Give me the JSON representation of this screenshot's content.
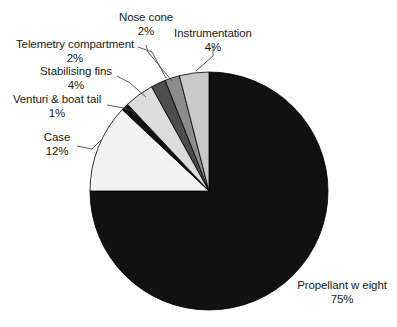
{
  "chart_data": {
    "type": "pie",
    "title": "",
    "subtitle": "",
    "xlabel": "",
    "ylabel": "",
    "grid": false,
    "legend_position": "none",
    "label_format": "name + percent",
    "start_angle_deg": 0,
    "direction": "clockwise",
    "categories": [
      "Propellant w eight",
      "Case",
      "Venturi & boat tail",
      "Stabilising fins",
      "Telemetry compartment",
      "Nose cone",
      "Instrumentation"
    ],
    "values": [
      75,
      12,
      1,
      4,
      2,
      2,
      4
    ],
    "unit": "%",
    "slices": [
      {
        "name": "Propellant w eight",
        "value": 75,
        "percent_label": "75%",
        "color": "#111111"
      },
      {
        "name": "Case",
        "value": 12,
        "percent_label": "12%",
        "color": "#f2f2f2"
      },
      {
        "name": "Venturi & boat tail",
        "value": 1,
        "percent_label": "1%",
        "color": "#111111"
      },
      {
        "name": "Stabilising fins",
        "value": 4,
        "percent_label": "4%",
        "color": "#dcdcdc"
      },
      {
        "name": "Telemetry compartment",
        "value": 2,
        "percent_label": "2%",
        "color": "#4d4d4d"
      },
      {
        "name": "Nose cone",
        "value": 2,
        "percent_label": "2%",
        "color": "#8c8c8c"
      },
      {
        "name": "Instrumentation",
        "value": 4,
        "percent_label": "4%",
        "color": "#c9c9c9"
      }
    ]
  },
  "labels": {
    "nose_cone": {
      "name": "Nose cone",
      "percent": "2%"
    },
    "instrumentation": {
      "name": "Instrumentation",
      "percent": "4%"
    },
    "telemetry": {
      "name": "Telemetry compartment",
      "percent": "2%"
    },
    "stabilising": {
      "name": "Stabilising fins",
      "percent": "4%"
    },
    "venturi": {
      "name": "Venturi & boat tail",
      "percent": "1%"
    },
    "case": {
      "name": "Case",
      "percent": "12%"
    },
    "propellant": {
      "name": "Propellant w eight",
      "percent": "75%"
    }
  },
  "style": {
    "background": "#ffffff",
    "outline": "#000000",
    "text": "#1a1a1a"
  }
}
